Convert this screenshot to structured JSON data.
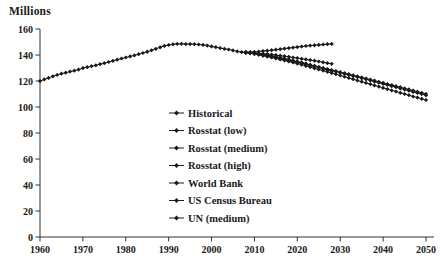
{
  "chart_data": {
    "type": "line",
    "title": "",
    "ylabel": "Millions",
    "xlabel": "",
    "xlim": [
      1960,
      2050
    ],
    "ylim": [
      0,
      160
    ],
    "x_ticks": [
      1960,
      1970,
      1980,
      1990,
      2000,
      2010,
      2020,
      2030,
      2040,
      2050
    ],
    "y_ticks": [
      0,
      20,
      40,
      60,
      80,
      100,
      120,
      140,
      160
    ],
    "grid": false,
    "legend_position": "inside-center",
    "series_color": "#1a1a1a",
    "axis_color": "#333333",
    "marker": "diamond",
    "series": [
      {
        "name": "Historical",
        "start_year": 1960,
        "values": [
          119.9,
          121.2,
          122.4,
          123.6,
          124.7,
          125.6,
          126.4,
          127.2,
          127.9,
          128.8,
          129.9,
          130.6,
          131.4,
          132.1,
          132.9,
          133.7,
          134.6,
          135.5,
          136.4,
          137.3,
          138.1,
          138.9,
          139.7,
          140.6,
          141.5,
          142.5,
          143.6,
          144.8,
          145.9,
          147.0,
          147.7,
          148.2,
          148.5,
          148.6,
          148.4,
          148.4,
          148.3,
          148.1,
          147.8,
          147.2,
          146.6,
          146.0,
          145.3,
          144.8,
          144.2,
          143.5,
          142.8,
          142.2,
          142.0
        ]
      },
      {
        "name": "Rosstat (low)",
        "start_year": 2008,
        "values": [
          142.0,
          141.7,
          141.3,
          140.9,
          140.4,
          139.9,
          139.3,
          138.7,
          138.0,
          137.3,
          136.6,
          135.8,
          135.0,
          134.2,
          133.3,
          132.4,
          131.5,
          130.6,
          129.6,
          128.6,
          127.6
        ]
      },
      {
        "name": "Rosstat (medium)",
        "start_year": 2008,
        "values": [
          142.0,
          141.8,
          141.6,
          141.3,
          141.0,
          140.7,
          140.3,
          139.9,
          139.5,
          139.1,
          138.6,
          138.1,
          137.6,
          137.1,
          136.6,
          136.1,
          135.6,
          135.0,
          134.4,
          133.8,
          133.2
        ]
      },
      {
        "name": "Rosstat (high)",
        "start_year": 2008,
        "values": [
          142.0,
          142.2,
          142.4,
          142.7,
          143.0,
          143.3,
          143.7,
          144.1,
          144.5,
          144.9,
          145.3,
          145.7,
          146.1,
          146.5,
          146.9,
          147.2,
          147.5,
          147.8,
          148.1,
          148.3,
          148.5
        ]
      },
      {
        "name": "World Bank",
        "start_year": 2008,
        "values": [
          142.0,
          141.5,
          141.0,
          140.4,
          139.8,
          139.2,
          138.6,
          137.9,
          137.2,
          136.5,
          135.8,
          135.1,
          134.4,
          133.6,
          132.8,
          132.0,
          131.2,
          130.4,
          129.6,
          128.8,
          128.0,
          127.2,
          126.4,
          125.5,
          124.7,
          123.8,
          123.0,
          122.1,
          121.3,
          120.4,
          119.5,
          118.7,
          117.8,
          116.9,
          116.0,
          115.2,
          114.3,
          113.4,
          112.5,
          111.6,
          110.8,
          109.9,
          109.0
        ]
      },
      {
        "name": "US Census Bureau",
        "start_year": 2008,
        "values": [
          142.0,
          141.6,
          141.1,
          140.6,
          140.0,
          139.4,
          138.8,
          138.2,
          137.5,
          136.8,
          136.1,
          135.4,
          134.7,
          134.0,
          133.2,
          132.4,
          131.6,
          130.8,
          130.0,
          129.2,
          128.4,
          127.6,
          126.8,
          126.0,
          125.2,
          124.4,
          123.6,
          122.8,
          121.9,
          121.1,
          120.3,
          119.4,
          118.6,
          117.7,
          116.9,
          116.0,
          115.2,
          114.3,
          113.5,
          112.6,
          111.8,
          110.9,
          110.1
        ]
      },
      {
        "name": "UN (medium)",
        "start_year": 2008,
        "values": [
          142.0,
          141.4,
          140.8,
          140.2,
          139.5,
          138.8,
          138.1,
          137.4,
          136.6,
          135.8,
          135.0,
          134.2,
          133.4,
          132.5,
          131.6,
          130.7,
          129.8,
          128.9,
          128.0,
          127.1,
          126.1,
          125.2,
          124.2,
          123.3,
          122.3,
          121.4,
          120.4,
          119.5,
          118.5,
          117.6,
          116.6,
          115.7,
          114.7,
          113.8,
          112.8,
          111.9,
          110.9,
          110.0,
          109.1,
          108.1,
          107.2,
          106.3,
          105.4
        ]
      }
    ]
  }
}
